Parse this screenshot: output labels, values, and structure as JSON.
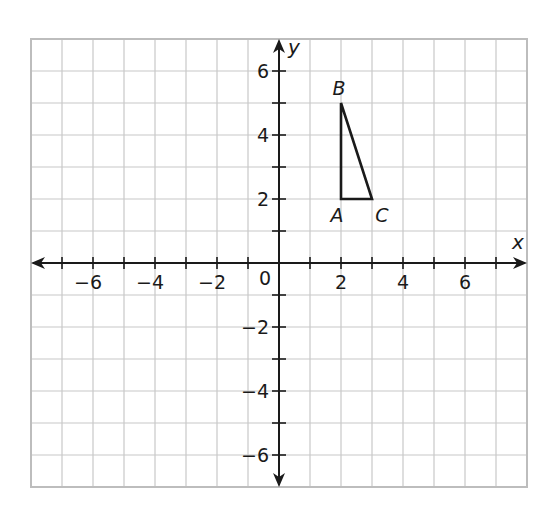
{
  "chart_data": {
    "type": "scatter",
    "title": "",
    "xlabel": "x",
    "ylabel": "y",
    "xlim": [
      -8,
      8
    ],
    "ylim": [
      -7,
      7
    ],
    "grid": true,
    "x_ticks": [
      -7,
      -6,
      -5,
      -4,
      -3,
      -2,
      -1,
      1,
      2,
      3,
      4,
      5,
      6,
      7
    ],
    "y_ticks": [
      -6,
      -5,
      -4,
      -3,
      -2,
      -1,
      1,
      2,
      3,
      4,
      5,
      6
    ],
    "x_tick_labels": [
      "−6",
      "−4",
      "−2",
      "2",
      "4",
      "6"
    ],
    "x_tick_label_values": [
      -6,
      -4,
      -2,
      2,
      4,
      6
    ],
    "y_tick_labels": [
      "6",
      "4",
      "2",
      "−2",
      "−4",
      "−6"
    ],
    "y_tick_label_values": [
      6,
      4,
      2,
      -2,
      -4,
      -6
    ],
    "origin_label": "0",
    "shapes": [
      {
        "name": "triangle ABC",
        "type": "polygon",
        "points": [
          {
            "label": "A",
            "x": 2,
            "y": 2
          },
          {
            "label": "B",
            "x": 2,
            "y": 5
          },
          {
            "label": "C",
            "x": 3,
            "y": 2
          }
        ]
      }
    ],
    "legend": null
  },
  "layout": {
    "origin_px": [
      279,
      263
    ],
    "unit_x_px": 31,
    "unit_y_px": 32,
    "grid_color": "#c8c8c8",
    "axis_color": "#1a1a1a",
    "shape_color": "#1a1a1a"
  }
}
